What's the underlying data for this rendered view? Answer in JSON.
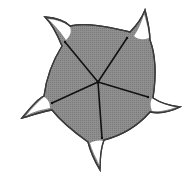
{
  "diagram": {
    "title": "",
    "colors": {
      "background": "#ffffff",
      "body_fill": "#8a8a8a",
      "outline": "#3a3a3a",
      "tip_fill": "#ffffff",
      "spoke": "#111111"
    },
    "center": {
      "x": 98,
      "y": 82
    },
    "arms": [
      {
        "name": "top-left",
        "tip": {
          "x": 45,
          "y": 17
        },
        "node": {
          "x": 65,
          "y": 42
        }
      },
      {
        "name": "top-right",
        "tip": {
          "x": 145,
          "y": 10
        },
        "node": {
          "x": 127,
          "y": 38
        }
      },
      {
        "name": "right",
        "tip": {
          "x": 180,
          "y": 107
        },
        "node": {
          "x": 148,
          "y": 97
        }
      },
      {
        "name": "bottom",
        "tip": {
          "x": 100,
          "y": 170
        },
        "node": {
          "x": 102,
          "y": 138
        }
      },
      {
        "name": "left",
        "tip": {
          "x": 22,
          "y": 118
        },
        "node": {
          "x": 52,
          "y": 103
        }
      }
    ]
  }
}
